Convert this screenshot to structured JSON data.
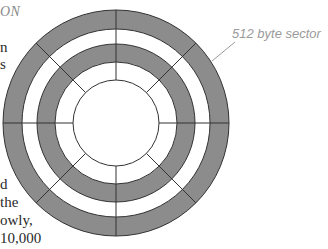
{
  "text_fragments": {
    "heading": "ON",
    "line1": "n",
    "line2": "s",
    "line3": "d",
    "line4": "the",
    "line5": "owly,",
    "line6": "10,000"
  },
  "diagram": {
    "sector_label": "512 byte sector",
    "sector_count": 8,
    "tracks": [
      {
        "name": "outer-track",
        "shaded": true
      },
      {
        "name": "outer-gap",
        "shaded": false
      },
      {
        "name": "inner-track",
        "shaded": true
      },
      {
        "name": "inner-gap",
        "shaded": false
      },
      {
        "name": "hub",
        "shaded": false
      }
    ],
    "colors": {
      "track_fill": "#8c8c8c",
      "gap_fill": "#ffffff",
      "stroke": "#333333",
      "label": "#9a9a9a"
    }
  }
}
